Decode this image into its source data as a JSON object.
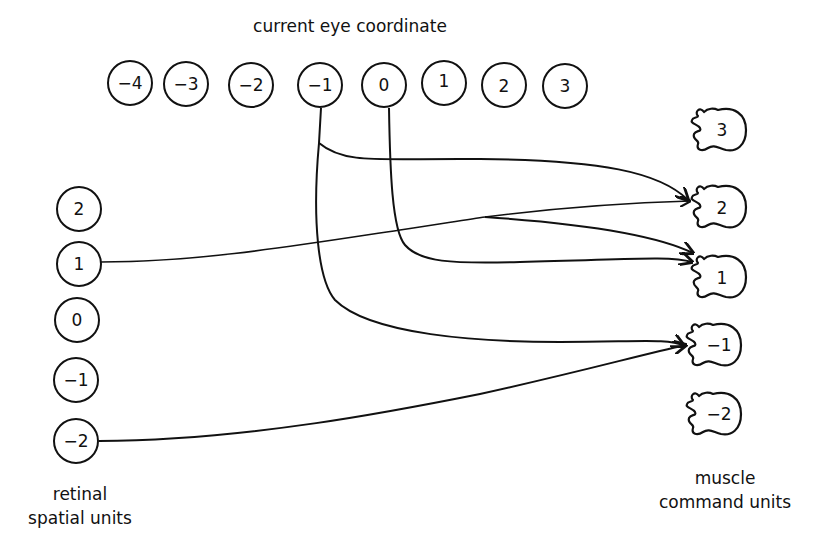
{
  "title": "current eye coordinate",
  "eye_units": {
    "label": "current eye coordinate",
    "items": [
      {
        "value": "−4",
        "cx": 130,
        "cy": 83
      },
      {
        "value": "−3",
        "cx": 186,
        "cy": 84
      },
      {
        "value": "−2",
        "cx": 251,
        "cy": 85
      },
      {
        "value": "−1",
        "cx": 320,
        "cy": 85
      },
      {
        "value": "0",
        "cx": 384,
        "cy": 85
      },
      {
        "value": "1",
        "cx": 444,
        "cy": 83
      },
      {
        "value": "2",
        "cx": 504,
        "cy": 85
      },
      {
        "value": "3",
        "cx": 565,
        "cy": 86
      }
    ]
  },
  "retinal_units": {
    "label_line1": "retinal",
    "label_line2": "spatial units",
    "items": [
      {
        "value": "2",
        "cx": 79,
        "cy": 209
      },
      {
        "value": "1",
        "cx": 79,
        "cy": 264
      },
      {
        "value": "0",
        "cx": 77,
        "cy": 320
      },
      {
        "value": "−1",
        "cx": 76,
        "cy": 380
      },
      {
        "value": "−2",
        "cx": 76,
        "cy": 441
      }
    ]
  },
  "muscle_units": {
    "label_line1": "muscle",
    "label_line2": "command units",
    "items": [
      {
        "value": "3",
        "x": 690,
        "y": 110
      },
      {
        "value": "2",
        "x": 690,
        "y": 187
      },
      {
        "value": "1",
        "x": 690,
        "y": 257
      },
      {
        "value": "−1",
        "x": 685,
        "y": 325
      },
      {
        "value": "−2",
        "x": 685,
        "y": 394
      }
    ]
  },
  "connections": [
    {
      "from": "eye −1",
      "to": "muscle 2"
    },
    {
      "from": "eye −1",
      "to": "muscle −1"
    },
    {
      "from": "eye 0",
      "to": "muscle 1"
    },
    {
      "from": "retinal 1",
      "to": "muscle 2"
    },
    {
      "from": "retinal 1",
      "to": "muscle 1"
    },
    {
      "from": "retinal −2",
      "to": "muscle −1"
    }
  ]
}
